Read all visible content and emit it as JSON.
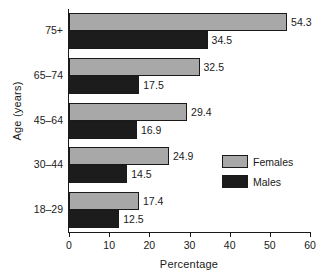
{
  "chart_data": {
    "type": "bar",
    "orientation": "horizontal",
    "title": "",
    "xlabel": "Percentage",
    "ylabel": "Age (years)",
    "categories": [
      "18–29",
      "30–44",
      "45–64",
      "65–74",
      "75+"
    ],
    "series": [
      {
        "name": "Females",
        "color": "#a8a8a8",
        "values": [
          17.4,
          24.9,
          29.4,
          32.5,
          54.3
        ],
        "labels": [
          "17.4",
          "24.9",
          "29.4",
          "32.5",
          "54.3"
        ]
      },
      {
        "name": "Males",
        "color": "#1c1c1c",
        "values": [
          12.5,
          14.5,
          16.9,
          17.5,
          34.5
        ],
        "labels": [
          "12.5",
          "14.5",
          "16.9",
          "17.5",
          "34.5"
        ]
      }
    ],
    "xlim": [
      0,
      60
    ],
    "xticks": [
      0,
      10,
      20,
      30,
      40,
      50,
      60
    ],
    "xtick_labels": [
      "0",
      "10",
      "20",
      "30",
      "40",
      "50",
      "60"
    ],
    "grid": false,
    "legend_position": "right-middle",
    "legend_entries": [
      "Females",
      "Males"
    ]
  },
  "legend": {
    "items": [
      {
        "label": "Females",
        "color": "#a8a8a8"
      },
      {
        "label": "Males",
        "color": "#1c1c1c"
      }
    ]
  },
  "axes": {
    "x_title": "Percentage",
    "y_title": "Age (years)"
  }
}
